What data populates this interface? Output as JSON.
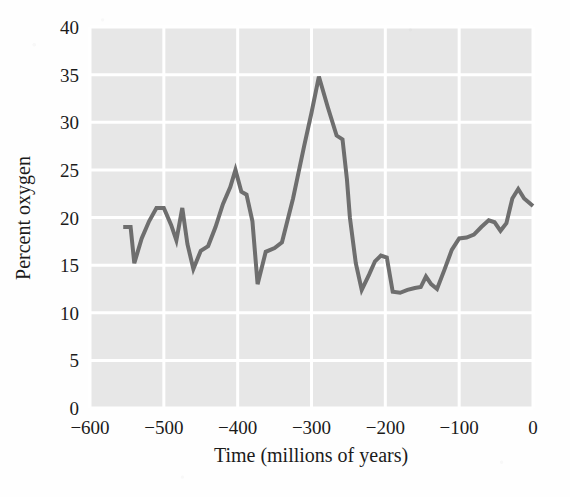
{
  "chart_data": {
    "type": "line",
    "title": "",
    "xlabel": "Time (millions of years)",
    "ylabel": "Percent oxygen",
    "xlim": [
      -600,
      0
    ],
    "ylim": [
      0,
      40
    ],
    "xticks": [
      -600,
      -500,
      -400,
      -300,
      -200,
      -100,
      0
    ],
    "xtick_labels": [
      "−600",
      "−500",
      "−400",
      "−300",
      "−200",
      "−100",
      "0"
    ],
    "yticks": [
      0,
      5,
      10,
      15,
      20,
      25,
      30,
      35,
      40
    ],
    "ytick_labels": [
      "0",
      "5",
      "10",
      "15",
      "20",
      "25",
      "30",
      "35",
      "40"
    ],
    "grid": true,
    "grid_color": "#ffffff",
    "plot_background": "#e7e7e7",
    "line_color": "#6e6e6e",
    "line_width": 4,
    "legend": null,
    "series": [
      {
        "name": "Atmospheric oxygen",
        "x": [
          -555,
          -545,
          -540,
          -530,
          -520,
          -510,
          -500,
          -490,
          -483,
          -475,
          -468,
          -460,
          -450,
          -440,
          -430,
          -420,
          -410,
          -403,
          -395,
          -388,
          -380,
          -373,
          -362,
          -350,
          -340,
          -325,
          -310,
          -300,
          -290,
          -278,
          -266,
          -258,
          -252,
          -248,
          -240,
          -232,
          -222,
          -214,
          -206,
          -198,
          -190,
          -180,
          -170,
          -160,
          -152,
          -145,
          -138,
          -130,
          -120,
          -110,
          -100,
          -90,
          -80,
          -70,
          -60,
          -52,
          -44,
          -36,
          -28,
          -20,
          -12,
          0
        ],
        "y": [
          19.0,
          19.0,
          15.2,
          17.8,
          19.6,
          21.0,
          21.0,
          19.2,
          17.6,
          21.0,
          17.2,
          14.6,
          16.5,
          17.0,
          19.0,
          21.4,
          23.2,
          25.0,
          22.7,
          22.4,
          19.6,
          13.0,
          16.4,
          16.8,
          17.4,
          22.0,
          27.5,
          31.0,
          34.8,
          31.6,
          28.6,
          28.2,
          24.0,
          20.0,
          15.2,
          12.4,
          14.0,
          15.4,
          16.0,
          15.8,
          12.2,
          12.1,
          12.4,
          12.6,
          12.7,
          13.8,
          13.0,
          12.5,
          14.5,
          16.6,
          17.8,
          17.9,
          18.2,
          19.0,
          19.7,
          19.5,
          18.6,
          19.4,
          22.0,
          23.0,
          22.0,
          21.2
        ]
      }
    ],
    "annotations": []
  },
  "labels": {
    "y_axis_title": "Percent oxygen",
    "x_axis_title": "Time (millions of years)"
  }
}
